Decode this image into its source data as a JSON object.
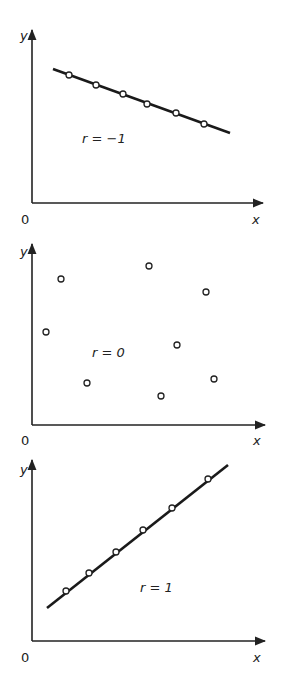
{
  "labels": {
    "x": "x",
    "y": "y",
    "origin": "0"
  },
  "panels": [
    {
      "annotation": "r = −1"
    },
    {
      "annotation": "r = 0"
    },
    {
      "annotation": "r = 1"
    }
  ],
  "chart_data": [
    {
      "type": "scatter",
      "title": "",
      "annotation": "r = -1",
      "xlabel": "x",
      "ylabel": "y",
      "grid": false,
      "fit_line": true,
      "points_px": [
        [
          69,
          75
        ],
        [
          96,
          85
        ],
        [
          123,
          94
        ],
        [
          147,
          104
        ],
        [
          176,
          113
        ],
        [
          204,
          124
        ]
      ],
      "line_px": [
        [
          53,
          69
        ],
        [
          230,
          133
        ]
      ]
    },
    {
      "type": "scatter",
      "title": "",
      "annotation": "r = 0",
      "xlabel": "x",
      "ylabel": "y",
      "grid": false,
      "fit_line": false,
      "points_px": [
        [
          46,
          332
        ],
        [
          61,
          279
        ],
        [
          87,
          383
        ],
        [
          149,
          266
        ],
        [
          161,
          396
        ],
        [
          177,
          345
        ],
        [
          206,
          292
        ],
        [
          214,
          379
        ]
      ]
    },
    {
      "type": "scatter",
      "title": "",
      "annotation": "r = 1",
      "xlabel": "x",
      "ylabel": "y",
      "grid": false,
      "fit_line": true,
      "points_px": [
        [
          66,
          591
        ],
        [
          89,
          573
        ],
        [
          116,
          552
        ],
        [
          143,
          530
        ],
        [
          172,
          508
        ],
        [
          208,
          479
        ]
      ],
      "line_px": [
        [
          47,
          608
        ],
        [
          228,
          465
        ]
      ]
    }
  ]
}
